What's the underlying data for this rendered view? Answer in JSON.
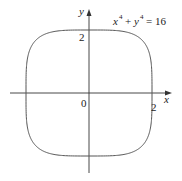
{
  "figure": {
    "equation_base_x": "x",
    "equation_exp_x": "4",
    "equation_plus": "+",
    "equation_base_y": "y",
    "equation_exp_y": "4",
    "equation_rhs": "= 16",
    "x_axis_label": "x",
    "y_axis_label": "y",
    "origin_label": "0",
    "x_tick_label": "2",
    "y_tick_label": "2",
    "curve_color": "#555555",
    "axis_color": "#333333"
  },
  "chart_data": {
    "type": "line",
    "xlabel": "x",
    "ylabel": "y",
    "x_ticks": [
      "2"
    ],
    "y_ticks": [
      "2"
    ],
    "origin": "0",
    "xlim": [
      -2.5,
      2.5
    ],
    "ylim": [
      -2.5,
      2.5
    ],
    "grid": false,
    "series": [
      {
        "name": "x^4 + y^4 = 16",
        "description": "closed superellipse curve with intercepts at (±2, 0) and (0, ±2)",
        "points": [
          [
            2,
            0
          ],
          [
            1.9,
            1.2
          ],
          [
            1.68,
            1.68
          ],
          [
            1.2,
            1.9
          ],
          [
            0,
            2
          ],
          [
            -1.2,
            1.9
          ],
          [
            -1.68,
            1.68
          ],
          [
            -1.9,
            1.2
          ],
          [
            -2,
            0
          ],
          [
            -1.9,
            -1.2
          ],
          [
            -1.68,
            -1.68
          ],
          [
            -1.2,
            -1.9
          ],
          [
            0,
            -2
          ],
          [
            1.2,
            -1.9
          ],
          [
            1.68,
            -1.68
          ],
          [
            1.9,
            -1.2
          ]
        ]
      }
    ]
  }
}
